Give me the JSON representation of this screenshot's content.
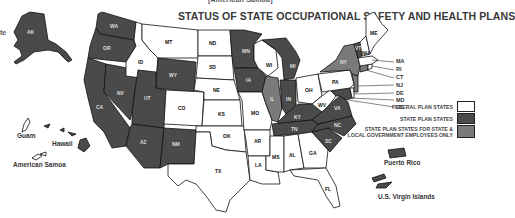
{
  "header": {
    "cropped_caption": "[American Samoa]",
    "title": "STATUS OF STATE OCCUPATIONAL SAFETY AND HEALTH PLANS",
    "edge_text": "te"
  },
  "colors": {
    "federal": "#ffffff",
    "state_plan": "#4a4a4a",
    "public_only": "#7a7a7a",
    "outline": "#111111"
  },
  "legend": [
    {
      "label": "FEDERAL PLAN STATES",
      "color": "#ffffff"
    },
    {
      "label": "STATE PLAN STATES",
      "color": "#4a4a4a"
    },
    {
      "label": "STATE PLAN STATES FOR STATE & LOCAL GOVERNMENT EMPLOYEES ONLY",
      "line1": "STATE PLAN STATES FOR STATE &",
      "line2": "LOCAL GOVERNMENT EMPLOYEES ONLY",
      "color": "#7a7a7a"
    }
  ],
  "states": {
    "state_plan": [
      "AK",
      "WA",
      "OR",
      "CA",
      "NV",
      "UT",
      "WY",
      "AZ",
      "NM",
      "MN",
      "IA",
      "MI",
      "IN",
      "KY",
      "TN",
      "NC",
      "SC",
      "VA",
      "MD",
      "VT"
    ],
    "public_only": [
      "IL",
      "NY",
      "CT",
      "NJ"
    ],
    "federal": [
      "MT",
      "ID",
      "ND",
      "SD",
      "NE",
      "CO",
      "KS",
      "OK",
      "TX",
      "MO",
      "AR",
      "LA",
      "MS",
      "AL",
      "GA",
      "FL",
      "WI",
      "OH",
      "WV",
      "PA",
      "ME",
      "NH",
      "MA",
      "RI",
      "DE",
      "DC"
    ]
  },
  "territories": {
    "guam": "Guam",
    "hawaii": "Hawaii",
    "american_samoa": "American Samoa",
    "puerto_rico": "Puerto Rico",
    "virgin_islands": "U.S. Virgin Islands"
  },
  "northeast_callouts": [
    "MA",
    "RI",
    "CT",
    "NJ",
    "DE",
    "MD",
    "DC"
  ],
  "labels": {
    "AK": "AK",
    "WA": "WA",
    "OR": "OR",
    "CA": "CA",
    "NV": "NV",
    "ID": "ID",
    "MT": "MT",
    "WY": "WY",
    "UT": "UT",
    "AZ": "AZ",
    "CO": "CO",
    "NM": "NM",
    "ND": "ND",
    "SD": "SD",
    "NE": "NE",
    "KS": "KS",
    "OK": "OK",
    "TX": "TX",
    "MN": "MN",
    "IA": "IA",
    "MO": "MO",
    "AR": "AR",
    "LA": "LA",
    "WI": "WI",
    "IL": "IL",
    "MI": "MI",
    "IN": "IN",
    "OH": "OH",
    "KY": "KY",
    "TN": "TN",
    "MS": "MS",
    "AL": "AL",
    "GA": "GA",
    "FL": "FL",
    "SC": "SC",
    "NC": "NC",
    "VA": "VA",
    "WV": "WV",
    "PA": "PA",
    "NY": "NY",
    "VT": "VT",
    "NH": "NH",
    "ME": "ME"
  }
}
